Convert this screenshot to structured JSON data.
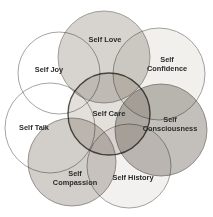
{
  "diagram": {
    "type": "venn-radial",
    "background_color": "#ffffff",
    "canvas": {
      "width": 213,
      "height": 217
    },
    "center": {
      "id": "self-care",
      "label": "Self Care",
      "label_lines": [
        "Self Care"
      ],
      "cx": 109,
      "cy": 114,
      "r": 41,
      "fill": "#dedad6",
      "fill_opacity": 0.85,
      "stroke": "#55524f",
      "stroke_width": 1.4,
      "font_size": 7.6,
      "label_x": 109,
      "label_y": 114
    },
    "petals": [
      {
        "id": "self-love",
        "label": "Self Love",
        "label_lines": [
          "Self Love"
        ],
        "position": "top",
        "cx": 104,
        "cy": 57,
        "r": 46,
        "fill": "#d2cec9",
        "fill_opacity": 0.88,
        "stroke": "#8d8a86",
        "stroke_width": 0.8,
        "font_size": 7.4,
        "label_x": 105,
        "label_y": 40,
        "line_height": 9
      },
      {
        "id": "self-confidence",
        "label": "Self Confidence",
        "label_lines": [
          "Self",
          "Confidence"
        ],
        "position": "upper-right",
        "cx": 159,
        "cy": 74,
        "r": 46,
        "fill": "#f0eeeb",
        "fill_opacity": 0.9,
        "stroke": "#8d8a86",
        "stroke_width": 0.8,
        "font_size": 7.4,
        "label_x": 167,
        "label_y": 64,
        "line_height": 9
      },
      {
        "id": "self-consciousness",
        "label": "Self Consciousness",
        "label_lines": [
          "Self",
          "Consciousness"
        ],
        "position": "right",
        "cx": 161,
        "cy": 130,
        "r": 46,
        "fill": "#bdb9b4",
        "fill_opacity": 0.9,
        "stroke": "#7c7975",
        "stroke_width": 0.8,
        "font_size": 7.4,
        "label_x": 170,
        "label_y": 124,
        "line_height": 9
      },
      {
        "id": "self-history",
        "label": "Self History",
        "label_lines": [
          "Self History"
        ],
        "position": "lower-right",
        "cx": 129,
        "cy": 166,
        "r": 42,
        "fill": "#f2f0ee",
        "fill_opacity": 0.9,
        "stroke": "#8d8a86",
        "stroke_width": 0.8,
        "font_size": 7.4,
        "label_x": 133,
        "label_y": 178,
        "line_height": 9
      },
      {
        "id": "self-compassion",
        "label": "Self Compassion",
        "label_lines": [
          "Self",
          "Compassion"
        ],
        "position": "lower-left",
        "cx": 72,
        "cy": 162,
        "r": 44,
        "fill": "#cdc9c4",
        "fill_opacity": 0.9,
        "stroke": "#7f7c78",
        "stroke_width": 0.8,
        "font_size": 7.4,
        "label_x": 75,
        "label_y": 178,
        "line_height": 9
      },
      {
        "id": "self-talk",
        "label": "Self Talk",
        "label_lines": [
          "Self Talk"
        ],
        "position": "left",
        "cx": 50,
        "cy": 128,
        "r": 45,
        "fill": "#ffffff",
        "fill_opacity": 0.0,
        "stroke": "#918e8a",
        "stroke_width": 0.8,
        "font_size": 7.4,
        "label_x": 34,
        "label_y": 128,
        "line_height": 9
      },
      {
        "id": "self-joy",
        "label": "Self Joy",
        "label_lines": [
          "Self Joy"
        ],
        "position": "upper-left",
        "cx": 59,
        "cy": 73,
        "r": 41,
        "fill": "#ffffff",
        "fill_opacity": 0.0,
        "stroke": "#918e8a",
        "stroke_width": 0.8,
        "font_size": 7.4,
        "label_x": 49,
        "label_y": 70,
        "line_height": 9
      }
    ]
  }
}
